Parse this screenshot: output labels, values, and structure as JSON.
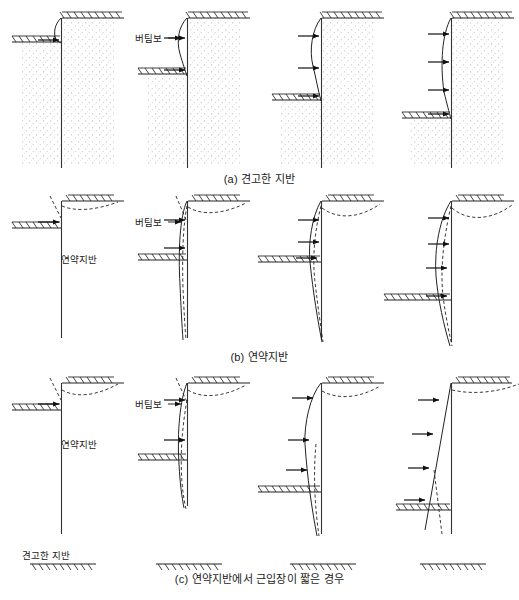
{
  "figure": {
    "title_visible": false,
    "rows": [
      {
        "id": "a",
        "caption": "(a) 견고한 지반",
        "ground_type": "견고한 지반",
        "soil_fill": "stippled",
        "description_visible_labels": [
          "버팀보"
        ],
        "panels": [
          {
            "index": 1,
            "struts": 1,
            "strut_label": "",
            "excavation_level_px": 40,
            "deflection": "small-cantilever-top",
            "settlement_dashed": false
          },
          {
            "index": 2,
            "struts": 2,
            "strut_label": "버팀보",
            "excavation_level_px": 72,
            "deflection": "small-bulge-upper",
            "settlement_dashed": false
          },
          {
            "index": 3,
            "struts": 3,
            "strut_label": "",
            "excavation_level_px": 98,
            "deflection": "bulge-mid",
            "settlement_dashed": false
          },
          {
            "index": 4,
            "struts": 4,
            "strut_label": "",
            "excavation_level_px": 115,
            "deflection": "bulge-deep",
            "settlement_dashed": false
          }
        ]
      },
      {
        "id": "b",
        "caption": "(b) 연약지반",
        "ground_type": "연약지반",
        "soil_fill": "none",
        "description_visible_labels": [
          "버팀보",
          "연약지반"
        ],
        "panels": [
          {
            "index": 1,
            "struts": 1,
            "strut_label": "",
            "excavation_level_px": 228,
            "deflection": "top-tilt",
            "settlement_dashed": true
          },
          {
            "index": 2,
            "struts": 2,
            "strut_label": "버팀보",
            "excavation_level_px": 260,
            "deflection": "deep-bulge-toe-kick",
            "settlement_dashed": true
          },
          {
            "index": 3,
            "struts": 3,
            "strut_label": "",
            "excavation_level_px": 262,
            "deflection": "deep-bulge-large",
            "settlement_dashed": true
          },
          {
            "index": 4,
            "struts": 4,
            "strut_label": "",
            "excavation_level_px": 300,
            "deflection": "deep-bulge-largest",
            "settlement_dashed": true
          }
        ]
      },
      {
        "id": "c",
        "caption": "(c) 연약지반에서 근입장이 짧은 경우",
        "ground_type": "연약지반",
        "base_label": "견고한 지반",
        "soil_fill": "none",
        "description_visible_labels": [
          "버팀보",
          "연약지반",
          "견고한 지반"
        ],
        "panels": [
          {
            "index": 1,
            "struts": 1,
            "strut_label": "",
            "excavation_level_px": 410,
            "deflection": "top-tilt",
            "settlement_dashed": true,
            "firm_base_bar": true
          },
          {
            "index": 2,
            "struts": 2,
            "strut_label": "버팀보",
            "excavation_level_px": 460,
            "deflection": "rotation-slight",
            "settlement_dashed": true,
            "firm_base_bar": true
          },
          {
            "index": 3,
            "struts": 3,
            "strut_label": "",
            "excavation_level_px": 492,
            "deflection": "rotation-moderate",
            "settlement_dashed": true,
            "firm_base_bar": true
          },
          {
            "index": 4,
            "struts": 4,
            "strut_label": "",
            "excavation_level_px": 510,
            "deflection": "rigid-body-rotation",
            "settlement_dashed": true,
            "firm_base_bar": true
          }
        ]
      }
    ],
    "legend_terms": {
      "strut": "버팀보",
      "soft_ground": "연약지반",
      "firm_ground": "견고한 지반"
    },
    "colors": {
      "line": "#222222",
      "wall": "#333333",
      "stipple": "#b9b9b9",
      "text": "#1a1a1a",
      "background": "#ffffff"
    }
  }
}
